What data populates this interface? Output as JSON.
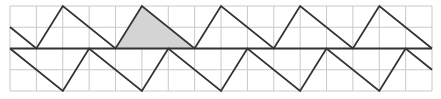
{
  "diagram": {
    "grid": {
      "x0": 10,
      "y0": 6,
      "cols": 16,
      "rows": 4,
      "cell_w": 26.375,
      "cell_h": 21.25,
      "color": "#c8c8c8"
    },
    "center_line": {
      "y": 48.5,
      "color": "#333333"
    },
    "upper_zigzag": [
      [
        10,
        27
      ],
      [
        36.4,
        48.5
      ],
      [
        62.8,
        6
      ],
      [
        115.5,
        48.5
      ],
      [
        141.9,
        6
      ],
      [
        194.6,
        48.5
      ],
      [
        221,
        6
      ],
      [
        273.8,
        48.5
      ],
      [
        300.1,
        6
      ],
      [
        352.9,
        48.5
      ],
      [
        379.3,
        6
      ],
      [
        432,
        48.5
      ]
    ],
    "lower_zigzag": [
      [
        10,
        48.5
      ],
      [
        62.8,
        91
      ],
      [
        89.1,
        48.5
      ],
      [
        141.9,
        91
      ],
      [
        168.3,
        48.5
      ],
      [
        221,
        91
      ],
      [
        247.4,
        48.5
      ],
      [
        300.1,
        91
      ],
      [
        326.5,
        48.5
      ],
      [
        379.3,
        91
      ],
      [
        405.6,
        48.5
      ],
      [
        432,
        69.7
      ]
    ],
    "shaded_triangle": {
      "points": [
        [
          115.5,
          48.5
        ],
        [
          141.9,
          6
        ],
        [
          194.6,
          48.5
        ]
      ],
      "fill": "#d4d4d4"
    },
    "line_color": "#333333"
  }
}
